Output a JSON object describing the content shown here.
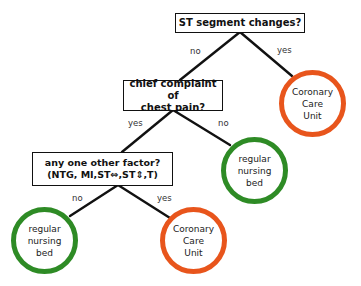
{
  "diagram": {
    "type": "decision-tree",
    "colors": {
      "line": "#111111",
      "box_border": "#111111",
      "green_outcome": "#2e8b25",
      "orange_outcome": "#e8551c"
    },
    "questions": [
      {
        "id": "q1",
        "lines": [
          "ST segment changes?"
        ]
      },
      {
        "id": "q2",
        "lines": [
          "chief complaint of",
          "chest pain?"
        ]
      },
      {
        "id": "q3",
        "lines": [
          "any one other factor?",
          "(NTG, MI,ST⇔,ST⇕,T)"
        ]
      }
    ],
    "edges": [
      {
        "from": "q1",
        "to": "q2",
        "label": "no"
      },
      {
        "from": "q1",
        "to": "o1",
        "label": "yes"
      },
      {
        "from": "q2",
        "to": "q3",
        "label": "yes"
      },
      {
        "from": "q2",
        "to": "o2",
        "label": "no"
      },
      {
        "from": "q3",
        "to": "o3",
        "label": "no"
      },
      {
        "from": "q3",
        "to": "o4",
        "label": "yes"
      }
    ],
    "outcomes": [
      {
        "id": "o1",
        "lines": [
          "Coronary",
          "Care",
          "Unit"
        ],
        "color": "orange"
      },
      {
        "id": "o2",
        "lines": [
          "regular",
          "nursing",
          "bed"
        ],
        "color": "green"
      },
      {
        "id": "o3",
        "lines": [
          "regular",
          "nursing",
          "bed"
        ],
        "color": "green"
      },
      {
        "id": "o4",
        "lines": [
          "Coronary",
          "Care",
          "Unit"
        ],
        "color": "orange"
      }
    ]
  }
}
